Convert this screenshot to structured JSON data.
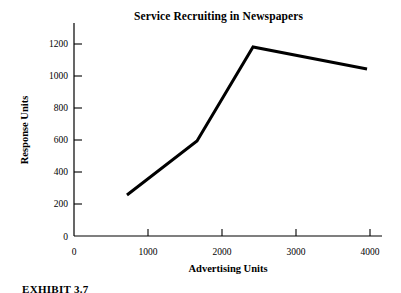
{
  "figure": {
    "title": "Service Recruiting in Newspapers",
    "caption": "EXHIBIT 3.7"
  },
  "chart_data": {
    "type": "line",
    "title": "Service Recruiting in Newspapers",
    "xlabel": "Advertising Units",
    "ylabel": "Response Units",
    "xlim": [
      0,
      4000
    ],
    "ylim": [
      0,
      1300
    ],
    "xticks": [
      0,
      1000,
      2000,
      3000,
      4000
    ],
    "yticks": [
      0,
      200,
      400,
      600,
      800,
      1000,
      1200
    ],
    "xtick_labels": [
      "0",
      "1000",
      "2000",
      "3000",
      "4000"
    ],
    "ytick_labels": [
      "0",
      "200",
      "400",
      "600",
      "800",
      "1000",
      "1200"
    ],
    "grid": false,
    "legend": null,
    "series": [
      {
        "name": "Response",
        "color": "#000000",
        "line_width": 3,
        "markers": false,
        "x": [
          716,
          1662,
          2419,
          3960
        ],
        "y": [
          256,
          594,
          1181,
          1044
        ]
      }
    ]
  },
  "axes": {
    "y_axis_name": "y-axis",
    "x_axis_name": "x-axis"
  }
}
